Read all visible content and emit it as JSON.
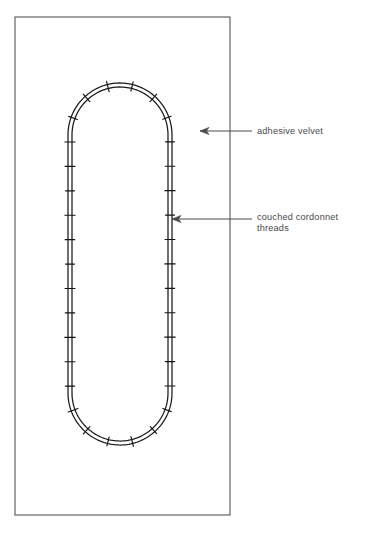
{
  "figure": {
    "kind": "embroidery-technique-diagram",
    "background_color": "#fefefe",
    "frame": {
      "name": "fabric-panel-border",
      "stroke_color": "#555555",
      "x": 15,
      "y": 17,
      "width": 215,
      "height": 498
    },
    "shape": {
      "name": "stadium-outline",
      "description": "elongated rounded oval (stadium) formed by two parallel couched cordonnet threads",
      "stroke_color": "#1a1a1a",
      "left_x": 70,
      "right_x": 170,
      "top_y": 85,
      "bottom_y": 443,
      "thread_gap": 4,
      "stitch_count": 34
    }
  },
  "annotations": [
    {
      "name": "adhesive-velvet",
      "label": "adhesive velvet",
      "lines": [
        "adhesive velvet"
      ],
      "arrow": {
        "tip_x": 200,
        "tip_y": 131,
        "tail_x": 252,
        "tail_y": 131,
        "direction": "left"
      },
      "text_x": 257,
      "text_y": 134,
      "stroke_color": "#4a4a4a"
    },
    {
      "name": "couched-cordonnet-threads",
      "label": "couched cordonnet threads",
      "lines": [
        "couched cordonnet",
        "threads"
      ],
      "arrow": {
        "tip_x": 172,
        "tip_y": 219,
        "tail_x": 252,
        "tail_y": 219,
        "direction": "left"
      },
      "text_x": 257,
      "text_y": 220,
      "line_height": 11,
      "stroke_color": "#4a4a4a"
    }
  ]
}
